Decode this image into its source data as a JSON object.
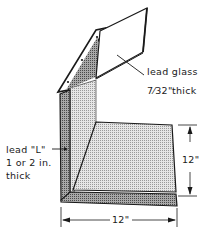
{
  "diagram": {
    "labels": {
      "glass_line1": "lead glass",
      "glass_frac": "7⁄32\"",
      "glass_thick": "thick",
      "lead_l_line1": "lead \"L\"",
      "lead_l_line2": "1 or 2 in.",
      "lead_l_line3": "thick"
    },
    "dimensions": {
      "height": "12\"",
      "width": "12\""
    },
    "colors": {
      "stroke": "#1a1a1a",
      "lead_fill": "#8c8c8c",
      "shelf_fill": "#d8d8d8",
      "glass_fill": "#ffffff"
    }
  }
}
